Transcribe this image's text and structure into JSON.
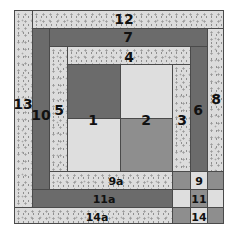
{
  "diagram": {
    "type": "quilt-block-piecing-diagram",
    "colors": {
      "speckled": "#dcdcdc",
      "dark": "#6b6b6b",
      "medium": "#8e8e8e",
      "light": "#dedede",
      "seam": "#4a4a4a"
    },
    "pieces": {
      "p1": {
        "label": "1"
      },
      "p2": {
        "label": "2"
      },
      "p3": {
        "label": "3"
      },
      "p4": {
        "label": "4"
      },
      "p5": {
        "label": "5"
      },
      "p6": {
        "label": "6"
      },
      "p7": {
        "label": "7"
      },
      "p8": {
        "label": "8"
      },
      "p9": {
        "label": "9"
      },
      "p9a": {
        "label": "9a"
      },
      "p10": {
        "label": "10"
      },
      "p11": {
        "label": "11"
      },
      "p11a": {
        "label": "11a"
      },
      "p12": {
        "label": "12"
      },
      "p13": {
        "label": "13"
      },
      "p14": {
        "label": "14"
      },
      "p14a": {
        "label": "14a"
      }
    }
  }
}
